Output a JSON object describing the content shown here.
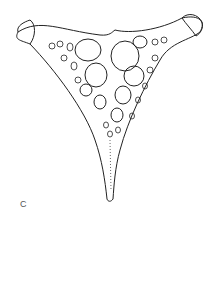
{
  "figure": {
    "panel_label": "C",
    "stroke_color": "#222222",
    "stipple_color": "#555555",
    "background": "#ffffff"
  }
}
